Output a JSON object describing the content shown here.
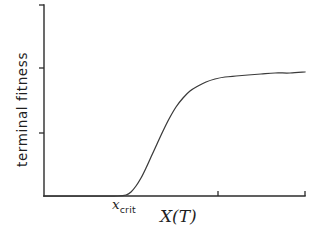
{
  "figure": {
    "background_color": "#ffffff",
    "line_color": "#2b2b2b",
    "curve_color": "#3a3a3a"
  },
  "labels": {
    "ylabel": "terminal fitness",
    "xlabel": "X(T)",
    "crit_base": "x",
    "crit_sub": "crit"
  },
  "chart_data": {
    "type": "line",
    "title": "",
    "xlabel": "X(T)",
    "ylabel": "terminal fitness",
    "x_tick_labels": [
      "x_crit"
    ],
    "y_tick_labels": [],
    "grid": false,
    "legend": null,
    "axis_style": "two-sided-open",
    "annotations": [
      {
        "text": "x_crit",
        "x_pixel": 133,
        "y_pixel": 204,
        "note": "marks the x location where the curve lifts off the baseline"
      }
    ],
    "xlim": [
      44,
      305
    ],
    "ylim": [
      196,
      5
    ],
    "x_ticks_pixel": [
      218,
      305
    ],
    "y_ticks_pixel": [
      5,
      68,
      133
    ],
    "series": [
      {
        "name": "terminal fitness",
        "shape": "sigmoid",
        "points_pixel": [
          [
            44,
            196
          ],
          [
            60,
            196
          ],
          [
            75,
            196
          ],
          [
            90,
            196
          ],
          [
            105,
            196
          ],
          [
            118,
            196
          ],
          [
            126,
            195
          ],
          [
            131,
            192
          ],
          [
            136,
            186
          ],
          [
            141,
            178
          ],
          [
            146,
            168
          ],
          [
            151,
            157
          ],
          [
            157,
            144
          ],
          [
            163,
            131
          ],
          [
            169,
            119
          ],
          [
            176,
            107
          ],
          [
            183,
            98
          ],
          [
            190,
            91
          ],
          [
            198,
            86
          ],
          [
            206,
            82
          ],
          [
            215,
            79
          ],
          [
            225,
            77
          ],
          [
            236,
            76
          ],
          [
            248,
            75
          ],
          [
            261,
            74
          ],
          [
            275,
            73
          ],
          [
            290,
            73
          ],
          [
            305,
            72
          ]
        ]
      }
    ]
  }
}
